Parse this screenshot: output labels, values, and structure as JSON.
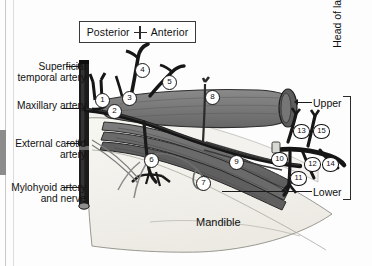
{
  "figure": {
    "type": "anatomical-diagram",
    "mandible_label": "Mandible"
  },
  "orientation": {
    "left_label": "Posterior",
    "right_label": "Anterior",
    "marker_icon": "cross-marker-icon"
  },
  "left_labels": [
    {
      "id": "superficial-temporal-artery",
      "text": "Superficial temporal artery"
    },
    {
      "id": "maxillary-artery",
      "text": "Maxillary artery"
    },
    {
      "id": "external-carotid-artery",
      "text": "External carotid artery"
    },
    {
      "id": "mylohyoid-artery-and-nerve",
      "text": "Mylohyoid artery and nerve"
    }
  ],
  "right_labels": {
    "upper_head": "Upper",
    "lower_head": "Lower",
    "bracket_label": "Head of lateral pterygoid muscle"
  },
  "markers": [
    {
      "n": "1",
      "x": 95,
      "y": 93
    },
    {
      "n": "2",
      "x": 107,
      "y": 104
    },
    {
      "n": "3",
      "x": 122,
      "y": 91
    },
    {
      "n": "4",
      "x": 135,
      "y": 63
    },
    {
      "n": "5",
      "x": 162,
      "y": 75
    },
    {
      "n": "6",
      "x": 144,
      "y": 153
    },
    {
      "n": "7",
      "x": 196,
      "y": 176
    },
    {
      "n": "8",
      "x": 205,
      "y": 90
    },
    {
      "n": "9",
      "x": 229,
      "y": 155
    },
    {
      "n": "10",
      "x": 271,
      "y": 152
    },
    {
      "n": "11",
      "x": 290,
      "y": 171
    },
    {
      "n": "12",
      "x": 304,
      "y": 157
    },
    {
      "n": "13",
      "x": 293,
      "y": 124
    },
    {
      "n": "14",
      "x": 322,
      "y": 157
    },
    {
      "n": "15",
      "x": 313,
      "y": 124
    }
  ],
  "colors": {
    "muscle_fill": "#6f6f6f",
    "muscle_dark": "#4a4a4a",
    "vessel_dark": "#1c1c1c",
    "bone_fill": "#f3f3ee",
    "outline": "#3a3a3a",
    "background": "#fdfdfd"
  }
}
